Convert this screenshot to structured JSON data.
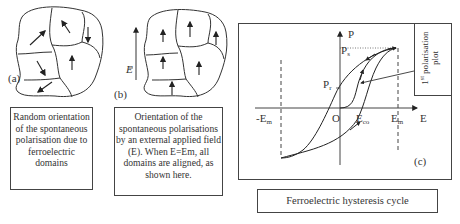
{
  "panel_a": {
    "label": "(a)",
    "caption": "Random orientation of the spontaneous polarisation due to ferroelectric domains"
  },
  "panel_b": {
    "label": "(b)",
    "field_symbol": "E",
    "caption": "Orientation of the spontaneous polarisations by an external applied field (E). When E=Em, all domains are aligned, as shown here."
  },
  "panel_c": {
    "label": "(c)",
    "axis_y": "P",
    "axis_x": "E",
    "origin": "O",
    "ps_main": "P",
    "ps_sub": "s",
    "pr_main": "P",
    "pr_sub": "r",
    "neg_em_main": "-E",
    "neg_em_sub": "m",
    "em_main": "E",
    "em_sub": "m",
    "eco_main": "E",
    "eco_sub": "co",
    "first_plot_line1_main": "1",
    "first_plot_line1_sup": "st",
    "first_plot_line1_rest": " polarisation",
    "first_plot_line2": "plot",
    "caption": "Ferroelectric hysteresis cycle"
  },
  "colors": {
    "line": "#333333",
    "border": "#444444",
    "background": "#ffffff"
  }
}
